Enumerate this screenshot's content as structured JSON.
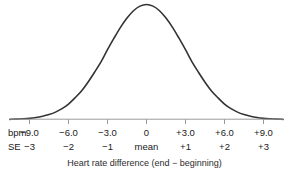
{
  "figure": {
    "caption": "Heart rate difference (end − beginning)",
    "background_color": "#ffffff",
    "curve_color": "#333333",
    "axis_color": "#9a9a9a",
    "text_color": "#1a1a1a"
  },
  "axis": {
    "bpm_row_title": "bpm",
    "se_row_title": "SE",
    "bpm_labels": [
      "−9.0",
      "−6.0",
      "−3.0",
      "0",
      "+3.0",
      "+6.0",
      "+9.0"
    ],
    "se_labels": [
      "−3",
      "−2",
      "−1",
      "mean",
      "+1",
      "+2",
      "+3"
    ]
  },
  "chart_data": {
    "type": "line",
    "title": "",
    "subtitle": "",
    "xlabel": "Heart rate difference (end − beginning)",
    "ylabel": "",
    "distribution": "normal",
    "mean": 0,
    "sd_in_bpm": 3.0,
    "x_unit": "bpm",
    "secondary_x_unit": "SE",
    "grid": false,
    "legend": "none",
    "xlim": [
      -10.5,
      10.5
    ],
    "ylim": [
      0,
      1
    ],
    "x_ticks": [
      -9,
      -6,
      -3,
      0,
      3,
      6,
      9
    ],
    "x_tick_labels": [
      "−9.0",
      "−6.0",
      "−3.0",
      "0",
      "+3.0",
      "+6.0",
      "+9.0"
    ],
    "secondary_x_ticks": [
      -3,
      -2,
      -1,
      0,
      1,
      2,
      3
    ],
    "secondary_x_tick_labels": [
      "−3",
      "−2",
      "−1",
      "mean",
      "+1",
      "+2",
      "+3"
    ],
    "x": [
      -10.5,
      -10.0,
      -9.5,
      -9.0,
      -8.5,
      -8.0,
      -7.5,
      -7.0,
      -6.5,
      -6.0,
      -5.5,
      -5.0,
      -4.5,
      -4.0,
      -3.5,
      -3.0,
      -2.5,
      -2.0,
      -1.5,
      -1.0,
      -0.5,
      0.0,
      0.5,
      1.0,
      1.5,
      2.0,
      2.5,
      3.0,
      3.5,
      4.0,
      4.5,
      5.0,
      5.5,
      6.0,
      6.5,
      7.0,
      7.5,
      8.0,
      8.5,
      9.0,
      9.5,
      10.0,
      10.5
    ],
    "y": [
      0.002,
      0.004,
      0.007,
      0.011,
      0.018,
      0.029,
      0.044,
      0.065,
      0.095,
      0.135,
      0.189,
      0.249,
      0.325,
      0.411,
      0.502,
      0.607,
      0.707,
      0.801,
      0.882,
      0.946,
      0.986,
      1.0,
      0.986,
      0.946,
      0.882,
      0.801,
      0.707,
      0.607,
      0.502,
      0.411,
      0.325,
      0.249,
      0.189,
      0.135,
      0.095,
      0.065,
      0.044,
      0.029,
      0.018,
      0.011,
      0.007,
      0.004,
      0.002
    ]
  }
}
